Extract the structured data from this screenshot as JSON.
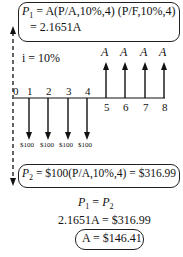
{
  "top_box": {
    "line1_lhs": "P",
    "line1_sub": "1",
    "line1_rhs": " = A(P/A,10%,4) (P/F,10%,4)",
    "line2": "= 2.1651A"
  },
  "interest": "i = 10%",
  "timeline": {
    "periods": [
      "0",
      "1",
      "2",
      "3",
      "4",
      "5",
      "6",
      "7",
      "8"
    ],
    "outflow_label": "$100",
    "inflow_label": "A"
  },
  "bottom_box": {
    "lhs": "P",
    "sub": "2",
    "rhs": " = $100(P/A,10%,4) = $316.99"
  },
  "equation1": {
    "a": "P",
    "a_sub": "1",
    "mid": " = ",
    "b": "P",
    "b_sub": "2"
  },
  "equation2": "2.1651A = $316.99",
  "result": "A = $146.41"
}
